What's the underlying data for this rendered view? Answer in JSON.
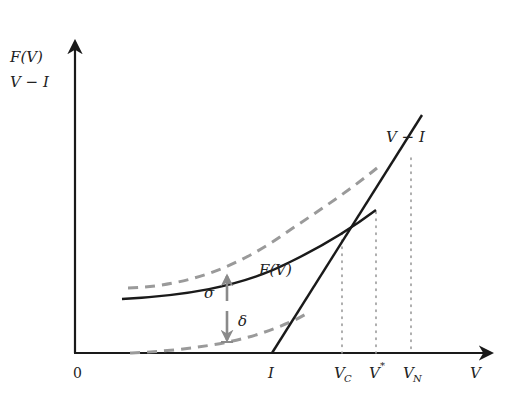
{
  "diagram": {
    "y_axis_labels": [
      "F(V)",
      "V − I"
    ],
    "x_axis_label": "V",
    "origin_label": "0",
    "x_ticks": [
      {
        "label": "I",
        "x": 272
      },
      {
        "label": "V",
        "sub": "C",
        "x": 342
      },
      {
        "label": "V",
        "sup": "*",
        "x": 376
      },
      {
        "label": "V",
        "sub": "N",
        "x": 411
      }
    ],
    "curve_labels": {
      "f_v": "F(V)",
      "v_minus_i": "V − I",
      "sigma": "σ",
      "delta": "δ"
    },
    "colors": {
      "solid": "#1a1a1a",
      "dashed": "#9a9a9a",
      "dotted": "#9a9a9a",
      "arrow": "#8a8a8a"
    }
  }
}
